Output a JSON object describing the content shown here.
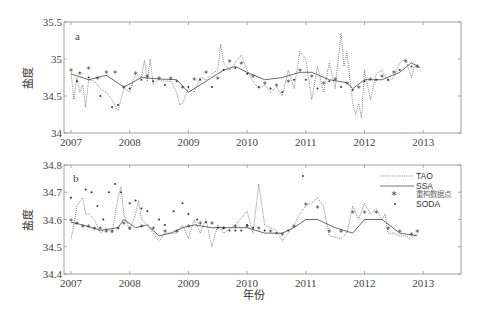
{
  "figure": {
    "xlabel": "年份",
    "ylabel": "盐度"
  },
  "legend": {
    "items": [
      {
        "label": "TAO",
        "style": "dotted-line"
      },
      {
        "label": "SSA",
        "style": "solid-line"
      },
      {
        "label": "重构数据点",
        "style": "asterisk-marker"
      },
      {
        "label": "SODA",
        "style": "dot-marker"
      }
    ]
  },
  "chart_data": [
    {
      "panel": "a",
      "type": "line",
      "title": "",
      "xlabel": "",
      "ylabel": "盐度",
      "xlim": [
        2007,
        2013.6
      ],
      "ylim": [
        34,
        35.5
      ],
      "xticks": [
        "2007",
        "2008",
        "2009",
        "2010",
        "2011",
        "2012",
        "2013"
      ],
      "yticks": [
        "34",
        "34.5",
        "35",
        "35.5"
      ],
      "grid": false,
      "series": [
        {
          "name": "TAO",
          "x": [
            2007.0,
            2007.05,
            2007.1,
            2007.15,
            2007.2,
            2007.25,
            2007.3,
            2007.4,
            2007.5,
            2007.6,
            2007.7,
            2007.8,
            2007.85,
            2007.9,
            2008.0,
            2008.1,
            2008.2,
            2008.25,
            2008.3,
            2008.35,
            2008.4,
            2008.5,
            2008.6,
            2008.7,
            2008.8,
            2008.85,
            2008.9,
            2009.0,
            2009.1,
            2009.2,
            2009.3,
            2009.4,
            2009.5,
            2009.55,
            2009.6,
            2009.7,
            2009.8,
            2009.9,
            2010.0,
            2010.1,
            2010.2,
            2010.3,
            2010.4,
            2010.5,
            2010.6,
            2010.7,
            2010.8,
            2010.9,
            2011.0,
            2011.1,
            2011.2,
            2011.3,
            2011.4,
            2011.5,
            2011.6,
            2011.65,
            2011.7,
            2011.8,
            2011.85,
            2011.9,
            2011.95,
            2012.0,
            2012.1,
            2012.2,
            2012.3,
            2012.4,
            2012.5,
            2012.6,
            2012.7,
            2012.8,
            2012.85,
            2012.9
          ],
          "values": [
            34.82,
            34.45,
            34.75,
            34.55,
            34.65,
            34.35,
            34.72,
            34.7,
            34.6,
            34.55,
            34.45,
            34.3,
            34.45,
            34.6,
            34.55,
            34.8,
            34.75,
            34.98,
            34.7,
            35.0,
            34.65,
            34.72,
            34.7,
            34.7,
            34.55,
            34.38,
            34.4,
            34.6,
            34.55,
            34.75,
            34.72,
            34.8,
            34.85,
            35.2,
            34.95,
            34.85,
            34.95,
            35.05,
            34.85,
            34.7,
            34.6,
            34.65,
            34.55,
            34.62,
            34.5,
            34.85,
            34.6,
            35.1,
            35.0,
            34.45,
            34.9,
            34.55,
            34.95,
            34.6,
            35.35,
            34.9,
            35.1,
            34.4,
            34.25,
            34.4,
            34.2,
            34.85,
            34.45,
            34.8,
            34.85,
            34.7,
            34.75,
            34.95,
            35.0,
            34.75,
            34.9,
            34.88
          ]
        },
        {
          "name": "SSA",
          "x": [
            2007.0,
            2007.3,
            2007.6,
            2007.9,
            2008.2,
            2008.5,
            2008.8,
            2009.0,
            2009.3,
            2009.6,
            2009.8,
            2010.0,
            2010.3,
            2010.6,
            2010.9,
            2011.1,
            2011.4,
            2011.7,
            2011.8,
            2012.0,
            2012.3,
            2012.6,
            2012.8,
            2012.95
          ],
          "values": [
            34.8,
            34.72,
            34.78,
            34.62,
            34.75,
            34.73,
            34.72,
            34.55,
            34.7,
            34.85,
            34.9,
            34.82,
            34.72,
            34.75,
            34.82,
            34.82,
            34.72,
            34.68,
            34.6,
            34.72,
            34.72,
            34.82,
            34.95,
            34.88
          ]
        },
        {
          "name": "重构数据点",
          "x": [
            2007.0,
            2007.15,
            2007.3,
            2007.45,
            2007.6,
            2007.75,
            2007.9,
            2008.1,
            2008.3,
            2008.5,
            2008.7,
            2008.9,
            2009.1,
            2009.3,
            2009.5,
            2009.7,
            2009.9,
            2010.1,
            2010.3,
            2010.5,
            2010.7,
            2010.9,
            2011.1,
            2011.3,
            2011.5,
            2011.7,
            2011.9,
            2012.1,
            2012.3,
            2012.5,
            2012.7,
            2012.9
          ],
          "values": [
            34.82,
            34.78,
            34.85,
            34.72,
            34.8,
            34.8,
            34.6,
            34.78,
            34.75,
            34.72,
            34.72,
            34.6,
            34.7,
            34.8,
            34.72,
            34.95,
            34.92,
            34.75,
            34.65,
            34.62,
            34.68,
            34.82,
            34.75,
            34.65,
            34.7,
            34.65,
            34.6,
            34.7,
            34.75,
            34.8,
            34.95,
            34.88
          ]
        },
        {
          "name": "SODA",
          "x": [
            2007.1,
            2007.3,
            2007.5,
            2007.7,
            2007.8,
            2008.0,
            2008.2,
            2008.4,
            2008.6,
            2008.8,
            2009.0,
            2009.2,
            2009.4,
            2009.6,
            2009.8,
            2010.0,
            2010.2,
            2010.4,
            2010.6,
            2010.8,
            2011.0,
            2011.2,
            2011.4,
            2011.6,
            2011.8,
            2012.0,
            2012.2,
            2012.4,
            2012.6,
            2012.8
          ],
          "values": [
            34.7,
            34.75,
            34.5,
            34.35,
            34.38,
            34.6,
            34.72,
            34.7,
            34.65,
            34.7,
            34.62,
            34.72,
            34.62,
            34.85,
            34.88,
            34.8,
            34.62,
            34.6,
            34.55,
            34.72,
            34.72,
            34.6,
            34.7,
            34.62,
            34.58,
            34.7,
            34.72,
            34.72,
            34.85,
            34.9
          ]
        }
      ]
    },
    {
      "panel": "b",
      "type": "line",
      "title": "",
      "xlabel": "年份",
      "ylabel": "盐度",
      "xlim": [
        2007,
        2013.6
      ],
      "ylim": [
        34.4,
        34.8
      ],
      "xticks": [
        "2007",
        "2008",
        "2009",
        "2010",
        "2011",
        "2012",
        "2013"
      ],
      "yticks": [
        "34.4",
        "34.5",
        "34.6",
        "34.7",
        "34.8"
      ],
      "grid": false,
      "legend_position": "upper right",
      "series": [
        {
          "name": "TAO",
          "x": [
            2007.0,
            2007.05,
            2007.1,
            2007.2,
            2007.25,
            2007.3,
            2007.4,
            2007.5,
            2007.6,
            2007.7,
            2007.8,
            2007.85,
            2007.9,
            2008.0,
            2008.1,
            2008.15,
            2008.2,
            2008.3,
            2008.4,
            2008.5,
            2008.6,
            2008.8,
            2008.9,
            2009.0,
            2009.1,
            2009.2,
            2009.3,
            2009.4,
            2009.5,
            2009.6,
            2009.8,
            2010.0,
            2010.1,
            2010.2,
            2010.3,
            2010.5,
            2010.6,
            2010.7,
            2010.8,
            2010.9,
            2011.0,
            2011.1,
            2011.2,
            2011.3,
            2011.4,
            2011.6,
            2011.7,
            2011.8,
            2011.9,
            2012.0,
            2012.1,
            2012.2,
            2012.3,
            2012.35,
            2012.4,
            2012.5,
            2012.6,
            2012.7,
            2012.8,
            2012.9
          ],
          "values": [
            34.53,
            34.58,
            34.65,
            34.68,
            34.62,
            34.62,
            34.6,
            34.55,
            34.57,
            34.55,
            34.68,
            34.72,
            34.62,
            34.56,
            34.62,
            34.67,
            34.6,
            34.58,
            34.55,
            34.52,
            34.55,
            34.55,
            34.58,
            34.53,
            34.6,
            34.55,
            34.6,
            34.5,
            34.58,
            34.55,
            34.58,
            34.63,
            34.55,
            34.73,
            34.58,
            34.56,
            34.52,
            34.55,
            34.58,
            34.62,
            34.65,
            34.66,
            34.68,
            34.65,
            34.54,
            34.53,
            34.55,
            34.65,
            34.6,
            34.66,
            34.62,
            34.64,
            34.6,
            34.62,
            34.55,
            34.55,
            34.54,
            34.54,
            34.53,
            34.55
          ]
        },
        {
          "name": "SSA",
          "x": [
            2007.0,
            2007.2,
            2007.5,
            2007.8,
            2007.9,
            2008.1,
            2008.3,
            2008.5,
            2008.7,
            2008.9,
            2009.1,
            2009.4,
            2009.7,
            2010.0,
            2010.3,
            2010.6,
            2010.8,
            2011.0,
            2011.2,
            2011.5,
            2011.8,
            2012.0,
            2012.3,
            2012.6,
            2012.9
          ],
          "values": [
            34.59,
            34.58,
            34.56,
            34.57,
            34.6,
            34.57,
            34.58,
            34.54,
            34.55,
            34.57,
            34.58,
            34.57,
            34.57,
            34.57,
            34.55,
            34.55,
            34.57,
            34.6,
            34.6,
            34.57,
            34.55,
            34.6,
            34.6,
            34.55,
            34.54
          ]
        },
        {
          "name": "重构数据点",
          "x": [
            2007.0,
            2007.1,
            2007.2,
            2007.3,
            2007.4,
            2007.5,
            2007.6,
            2007.7,
            2007.8,
            2007.9,
            2008.0,
            2008.2,
            2008.4,
            2008.6,
            2008.8,
            2009.0,
            2009.2,
            2009.4,
            2009.6,
            2009.8,
            2010.0,
            2010.2,
            2010.4,
            2010.6,
            2010.8,
            2011.0,
            2011.2,
            2011.4,
            2011.6,
            2011.8,
            2012.0,
            2012.2,
            2012.4,
            2012.6,
            2012.8,
            2012.9
          ],
          "values": [
            34.59,
            34.58,
            34.57,
            34.57,
            34.56,
            34.56,
            34.55,
            34.55,
            34.56,
            34.58,
            34.56,
            34.57,
            34.56,
            34.55,
            34.55,
            34.57,
            34.58,
            34.58,
            34.56,
            34.57,
            34.57,
            34.56,
            34.55,
            34.54,
            34.57,
            34.65,
            34.64,
            34.55,
            34.55,
            34.62,
            34.62,
            34.62,
            34.56,
            34.55,
            34.54,
            34.55
          ]
        },
        {
          "name": "SODA",
          "x": [
            2007.0,
            2007.25,
            2007.35,
            2007.45,
            2007.55,
            2007.65,
            2007.75,
            2007.85,
            2008.0,
            2008.1,
            2008.2,
            2008.3,
            2008.5,
            2008.6,
            2008.75,
            2008.9,
            2009.0,
            2009.15,
            2009.3,
            2009.5,
            2009.6,
            2009.7,
            2009.8,
            2009.9,
            2010.0,
            2010.1,
            2010.3,
            2010.5,
            2010.7,
            2010.95
          ],
          "values": [
            34.68,
            34.71,
            34.7,
            34.65,
            34.6,
            34.7,
            34.73,
            34.7,
            34.66,
            34.67,
            34.64,
            34.63,
            34.6,
            34.58,
            34.63,
            34.66,
            34.62,
            34.6,
            34.59,
            34.57,
            34.57,
            34.56,
            34.56,
            34.56,
            34.58,
            34.57,
            34.56,
            34.55,
            34.56,
            34.76
          ]
        }
      ]
    }
  ]
}
